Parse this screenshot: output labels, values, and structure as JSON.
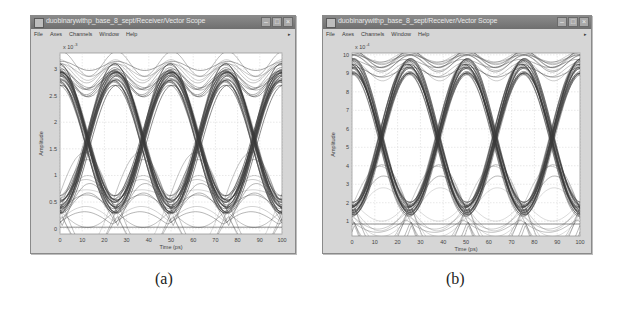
{
  "windows": [
    {
      "id": "a",
      "title": "duobinarywithp_base_8_sept/Receiver/Vector Scope",
      "menu": [
        "File",
        "Axes",
        "Channels",
        "Window",
        "Help"
      ],
      "window_buttons": [
        "minimize",
        "maximize",
        "close"
      ],
      "caption": "(a)",
      "exponent_label": "x 10",
      "exponent_power": "-3"
    },
    {
      "id": "b",
      "title": "duobinarywithp_base_8_sept/Receiver/Vector Scope",
      "menu": [
        "File",
        "Axes",
        "Channels",
        "Window",
        "Help"
      ],
      "window_buttons": [
        "minimize",
        "maximize",
        "close"
      ],
      "caption": "(b)",
      "exponent_label": "x 10",
      "exponent_power": "-4"
    }
  ],
  "chart_data": [
    {
      "type": "line",
      "title": "Eye diagram (a)",
      "xlabel": "Time (ps)",
      "ylabel": "Amplitude",
      "xlim": [
        0,
        100
      ],
      "ylim": [
        -0.1,
        3.3
      ],
      "y_scale": "x 10^-3",
      "x_ticks": [
        0,
        10,
        20,
        30,
        40,
        50,
        60,
        70,
        80,
        90,
        100
      ],
      "y_ticks": [
        0,
        0.5,
        1,
        1.5,
        2,
        2.5,
        3
      ],
      "y_tick_labels": [
        "0",
        "0.5",
        "1",
        "1.5",
        "2",
        "2.5",
        "3"
      ],
      "grid": true,
      "eye_period_ps": 25,
      "eye_crossings_ps": [
        12.5,
        37.5,
        62.5,
        87.5
      ],
      "levels": {
        "high": 3.1,
        "upper_band": 2.7,
        "crossing": 1.7,
        "low": 0.55,
        "floor": 0.0
      },
      "series": [
        {
          "name": "signal traces",
          "color": "#3a3a3a"
        }
      ]
    },
    {
      "type": "line",
      "title": "Eye diagram (b)",
      "xlabel": "Time (ps)",
      "ylabel": "Amplitude",
      "xlim": [
        0,
        100
      ],
      "ylim": [
        0.2,
        10.1
      ],
      "y_scale": "x 10^-4",
      "x_ticks": [
        0,
        10,
        20,
        30,
        40,
        50,
        60,
        70,
        80,
        90,
        100
      ],
      "y_ticks": [
        1,
        2,
        3,
        4,
        5,
        6,
        7,
        8,
        9,
        10
      ],
      "y_tick_labels": [
        "1",
        "2",
        "3",
        "4",
        "5",
        "6",
        "7",
        "8",
        "9",
        "10"
      ],
      "grid": true,
      "eye_period_ps": 25,
      "eye_crossings_ps": [
        12.5,
        37.5,
        62.5,
        87.5
      ],
      "levels": {
        "high": 9.9,
        "upper_band": 9.0,
        "crossing": 5.5,
        "low": 1.8,
        "floor": 0.8
      },
      "series": [
        {
          "name": "signal traces",
          "color": "#3a3a3a"
        }
      ]
    }
  ]
}
